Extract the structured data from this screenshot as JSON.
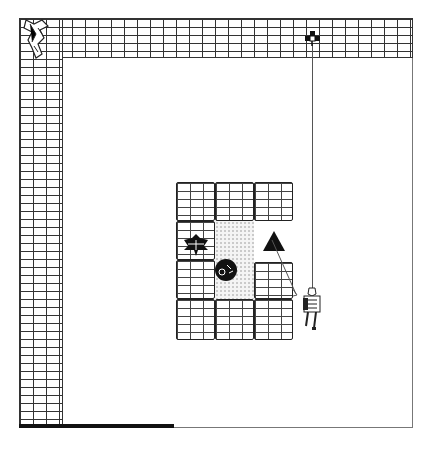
{
  "game": {
    "title": "Dungeon Map",
    "colors": {
      "wall_line": "#333333",
      "background": "#ffffff",
      "frame": "#777777",
      "floor_dots": "#999999",
      "progress_bar": "#111111"
    },
    "entities": [
      {
        "name": "player-climber",
        "icon": "climber-on-rope-icon"
      },
      {
        "name": "wall-creature",
        "icon": "crumbling-figure-icon"
      },
      {
        "name": "rope-anchor",
        "icon": "anchor-icon"
      },
      {
        "name": "bat-enemy",
        "icon": "bat-icon"
      },
      {
        "name": "boulder",
        "icon": "boulder-icon"
      },
      {
        "name": "triangle-marker",
        "icon": "triangle-icon"
      }
    ],
    "progress_percent": 40
  }
}
